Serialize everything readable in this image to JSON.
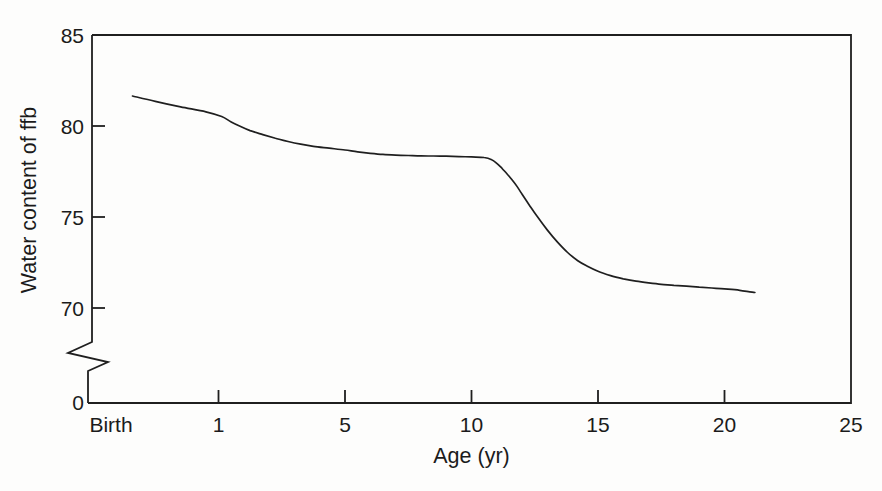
{
  "figure": {
    "background_color": "#fdfdfc",
    "line_color": "#1f1f1f",
    "text_color": "#1b1b1b"
  },
  "chart_data": {
    "type": "line",
    "title": "",
    "xlabel": "Age (yr)",
    "ylabel": "Water content of ffb",
    "grid": false,
    "legend": false,
    "x_axis": {
      "tick_labels": [
        "Birth",
        "1",
        "5",
        "10",
        "15",
        "20",
        "25"
      ],
      "tick_values": [
        0,
        1,
        5,
        10,
        15,
        20,
        25
      ],
      "range": [
        0,
        25
      ],
      "note": "ticks are equally spaced; scale is piecewise between labeled values"
    },
    "y_axis": {
      "tick_labels": [
        "85",
        "80",
        "75",
        "70"
      ],
      "tick_values": [
        85,
        80,
        75,
        70
      ],
      "origin_label": "0",
      "axis_break": true,
      "display_range": [
        70,
        85
      ]
    },
    "series": [
      {
        "name": "water-content-vs-age",
        "points": [
          [
            0.32,
            81.65
          ],
          [
            0.5,
            81.35
          ],
          [
            0.7,
            81.05
          ],
          [
            0.9,
            80.78
          ],
          [
            1.1,
            80.52
          ],
          [
            1.4,
            80.22
          ],
          [
            1.7,
            79.97
          ],
          [
            2.0,
            79.75
          ],
          [
            2.4,
            79.53
          ],
          [
            2.8,
            79.33
          ],
          [
            3.2,
            79.15
          ],
          [
            3.6,
            79.0
          ],
          [
            4.0,
            78.88
          ],
          [
            4.5,
            78.78
          ],
          [
            5.0,
            78.68
          ],
          [
            5.5,
            78.58
          ],
          [
            6.0,
            78.5
          ],
          [
            6.5,
            78.44
          ],
          [
            7.0,
            78.4
          ],
          [
            7.5,
            78.38
          ],
          [
            8.0,
            78.36
          ],
          [
            8.5,
            78.35
          ],
          [
            9.0,
            78.34
          ],
          [
            9.5,
            78.32
          ],
          [
            10.0,
            78.3
          ],
          [
            10.5,
            78.27
          ],
          [
            10.8,
            78.15
          ],
          [
            11.0,
            77.95
          ],
          [
            11.2,
            77.68
          ],
          [
            11.4,
            77.38
          ],
          [
            11.6,
            77.05
          ],
          [
            11.8,
            76.68
          ],
          [
            12.0,
            76.25
          ],
          [
            12.3,
            75.62
          ],
          [
            12.6,
            75.02
          ],
          [
            13.0,
            74.28
          ],
          [
            13.4,
            73.62
          ],
          [
            13.8,
            73.05
          ],
          [
            14.2,
            72.6
          ],
          [
            14.6,
            72.28
          ],
          [
            15.0,
            72.02
          ],
          [
            15.5,
            71.78
          ],
          [
            16.0,
            71.6
          ],
          [
            16.5,
            71.47
          ],
          [
            17.0,
            71.38
          ],
          [
            17.5,
            71.3
          ],
          [
            18.0,
            71.25
          ],
          [
            18.5,
            71.2
          ],
          [
            19.0,
            71.15
          ],
          [
            19.5,
            71.1
          ],
          [
            20.0,
            71.05
          ],
          [
            20.6,
            70.97
          ],
          [
            21.2,
            70.85
          ]
        ]
      }
    ]
  }
}
